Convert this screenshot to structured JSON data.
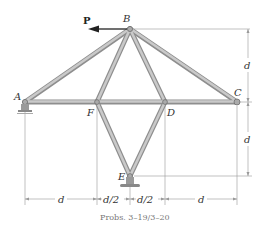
{
  "diagram": {
    "type": "truss",
    "load": {
      "label": "P",
      "direction": "left",
      "at": "B"
    },
    "joints": [
      {
        "name": "A",
        "x": 25,
        "y": 102
      },
      {
        "name": "B",
        "x": 130,
        "y": 29
      },
      {
        "name": "C",
        "x": 237,
        "y": 102
      },
      {
        "name": "D",
        "x": 165,
        "y": 102
      },
      {
        "name": "E",
        "x": 130,
        "y": 176
      },
      {
        "name": "F",
        "x": 97,
        "y": 102
      }
    ],
    "members": [
      "AB",
      "BC",
      "BF",
      "BD",
      "AF",
      "FD",
      "DC",
      "FE",
      "DE"
    ],
    "supports": [
      {
        "at": "A",
        "type": "rocker"
      },
      {
        "at": "E",
        "type": "pin"
      }
    ],
    "dimensions": {
      "horizontal": [
        "d",
        "d/2",
        "d/2",
        "d"
      ],
      "vertical": [
        "d",
        "d"
      ]
    },
    "caption": "Probs. 3–19/3–20"
  }
}
